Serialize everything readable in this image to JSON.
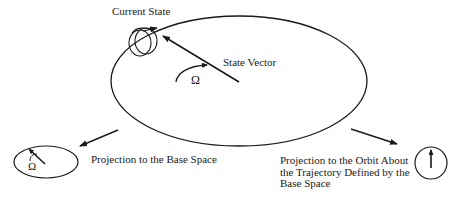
{
  "diagram": {
    "labels": {
      "current_state": "Current State",
      "state_vector": "State Vector",
      "omega_main": "Ω",
      "omega_base": "Ω",
      "projection_base": "Projection to the Base Space",
      "projection_orbit": {
        "line1": "Projection to the Orbit About",
        "line2": "the Trajectory Defined by the",
        "line3": "Base Space"
      }
    },
    "colors": {
      "stroke": "#1a1a1a",
      "background": "#ffffff"
    }
  }
}
